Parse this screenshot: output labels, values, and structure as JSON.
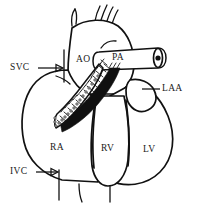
{
  "figure": {
    "background_color": "#ffffff",
    "line_color": "#111111",
    "width": 201,
    "height": 204
  },
  "labels": {
    "svc": "SVC",
    "ivc": "IVC",
    "ao": "AO",
    "pa": "PA",
    "laa": "LAA",
    "ra": "RA",
    "rv": "RV",
    "lv": "LV"
  },
  "structures": [
    {
      "key": "svc",
      "name": "superior-vena-cava",
      "label": "SVC",
      "leader": "arrow-right"
    },
    {
      "key": "ivc",
      "name": "inferior-vena-cava",
      "label": "IVC",
      "leader": "arrow-right"
    },
    {
      "key": "ao",
      "name": "aorta",
      "label": "AO",
      "leader": "none"
    },
    {
      "key": "pa",
      "name": "pulmonary-artery",
      "label": "PA",
      "leader": "none"
    },
    {
      "key": "laa",
      "name": "left-atrial-appendage",
      "label": "LAA",
      "leader": "line-left"
    },
    {
      "key": "ra",
      "name": "right-atrium",
      "label": "RA",
      "leader": "none"
    },
    {
      "key": "rv",
      "name": "right-ventricle",
      "label": "RV",
      "leader": "none"
    },
    {
      "key": "lv",
      "name": "left-ventricle",
      "label": "LV",
      "leader": "none"
    }
  ]
}
